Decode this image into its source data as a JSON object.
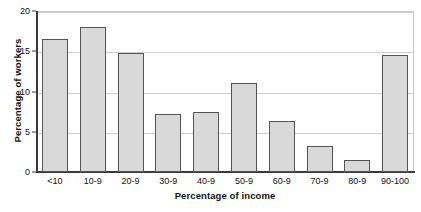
{
  "chart_data": {
    "type": "bar",
    "title": "",
    "xlabel": "Percentage of income",
    "ylabel": "Percentage of workers",
    "categories": [
      "<10",
      "10-9",
      "20-9",
      "30-9",
      "40-9",
      "50-9",
      "60-9",
      "70-9",
      "80-9",
      "90-100"
    ],
    "values": [
      16.5,
      18.0,
      14.8,
      7.2,
      7.5,
      11.0,
      6.3,
      3.2,
      1.5,
      14.5
    ],
    "ylim": [
      0,
      20
    ],
    "yticks": [
      0,
      5,
      10,
      15,
      20
    ],
    "ytick_labels": [
      "0",
      "5",
      "10",
      "15",
      "20"
    ],
    "grid": true,
    "grid_axis": "y",
    "legend": "none",
    "bar_fill_color": "#d9d9d9",
    "bar_edge_color": "#555555",
    "axis_color": "#3a3a3a",
    "grid_color": "#cfcfcf"
  }
}
